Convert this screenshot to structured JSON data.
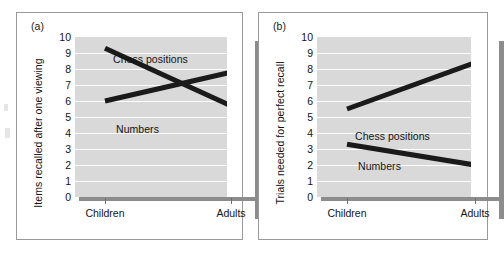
{
  "figure": {
    "background_color": "#ffffff",
    "plot_area_color": "#d9d9d9",
    "gridline_color": "#ffffff",
    "line_color": "#1a1a1a",
    "shadow_color": "#8c8c8c",
    "frame_border_color": "#9a9a9a"
  },
  "panels": [
    {
      "tag": "(a)",
      "ylabel": "Items recalled after one viewing",
      "yticks": [
        "10",
        "9",
        "8",
        "7",
        "6",
        "5",
        "4",
        "3",
        "2",
        "1",
        "0"
      ],
      "xticks": [
        "Children",
        "Adults"
      ],
      "series_labels": {
        "chess": "Chess positions",
        "numbers": "Numbers"
      }
    },
    {
      "tag": "(b)",
      "ylabel": "Trials needed for perfect recall",
      "yticks": [
        "10",
        "9",
        "8",
        "7",
        "6",
        "5",
        "4",
        "3",
        "2",
        "1",
        "0"
      ],
      "xticks": [
        "Children",
        "Adults"
      ],
      "series_labels": {
        "chess": "Chess positions",
        "numbers": "Numbers"
      }
    }
  ],
  "chart_data": [
    {
      "type": "line",
      "title": "(a)",
      "xlabel": "",
      "ylabel": "Items recalled after one viewing",
      "categories": [
        "Children",
        "Adults"
      ],
      "x": [
        "Children",
        "Adults"
      ],
      "ylim": [
        0,
        10
      ],
      "ytick_values": [
        0,
        1,
        2,
        3,
        4,
        5,
        6,
        7,
        8,
        9,
        10
      ],
      "grid": true,
      "legend": "inline-labels",
      "series": [
        {
          "name": "Chess positions",
          "values": [
            9.3,
            5.7
          ]
        },
        {
          "name": "Numbers",
          "values": [
            6.0,
            7.8
          ]
        }
      ],
      "annotations": [
        {
          "text": "Chess positions",
          "x": "Children",
          "y": 9.5
        },
        {
          "text": "Numbers",
          "x": "Children",
          "y": 5.7
        }
      ]
    },
    {
      "type": "line",
      "title": "(b)",
      "xlabel": "",
      "ylabel": "Trials needed for perfect recall",
      "categories": [
        "Children",
        "Adults"
      ],
      "x": [
        "Children",
        "Adults"
      ],
      "ylim": [
        0,
        10
      ],
      "ytick_values": [
        0,
        1,
        2,
        3,
        4,
        5,
        6,
        7,
        8,
        9,
        10
      ],
      "grid": true,
      "legend": "inline-labels",
      "series": [
        {
          "name": "Chess positions",
          "values": [
            5.5,
            8.4
          ]
        },
        {
          "name": "Numbers",
          "values": [
            3.3,
            2.0
          ]
        }
      ],
      "annotations": [
        {
          "text": "Chess positions",
          "x": "Children",
          "y": 5.0
        },
        {
          "text": "Numbers",
          "x": "Children",
          "y": 3.7
        }
      ]
    }
  ]
}
